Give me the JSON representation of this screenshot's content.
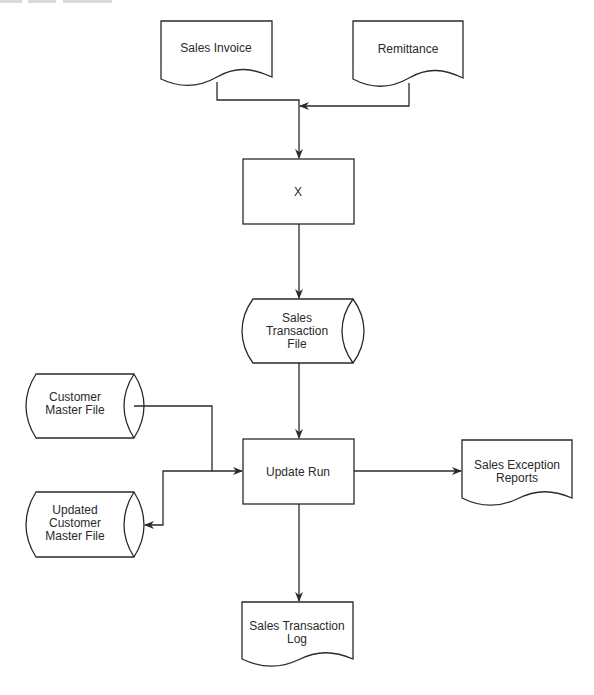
{
  "diagram": {
    "type": "system flowchart",
    "nodes": {
      "sales_invoice": {
        "shape": "document",
        "label": [
          "Sales Invoice"
        ]
      },
      "remittance": {
        "shape": "document",
        "label": [
          "Remittance"
        ]
      },
      "x_process": {
        "shape": "process",
        "label": [
          "X"
        ]
      },
      "sales_transaction_file": {
        "shape": "magnetic-disk",
        "label": [
          "Sales",
          "Transaction",
          "File"
        ]
      },
      "customer_master_file": {
        "shape": "magnetic-disk",
        "label": [
          "Customer",
          "Master File"
        ]
      },
      "updated_customer_master_file": {
        "shape": "magnetic-disk",
        "label": [
          "Updated",
          "Customer",
          "Master File"
        ]
      },
      "update_run": {
        "shape": "process",
        "label": [
          "Update Run"
        ]
      },
      "sales_exception_reports": {
        "shape": "document",
        "label": [
          "Sales Exception",
          "Reports"
        ]
      },
      "sales_transaction_log": {
        "shape": "document",
        "label": [
          "Sales Transaction",
          "Log"
        ]
      }
    },
    "edges": [
      {
        "from": "sales_invoice",
        "to": "x_process"
      },
      {
        "from": "remittance",
        "to": "x_process"
      },
      {
        "from": "x_process",
        "to": "sales_transaction_file"
      },
      {
        "from": "sales_transaction_file",
        "to": "update_run"
      },
      {
        "from": "customer_master_file",
        "to": "update_run"
      },
      {
        "from": "update_run",
        "to": "updated_customer_master_file"
      },
      {
        "from": "update_run",
        "to": "sales_exception_reports"
      },
      {
        "from": "update_run",
        "to": "sales_transaction_log"
      }
    ]
  }
}
